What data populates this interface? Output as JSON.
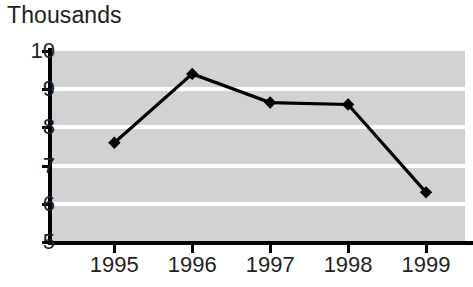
{
  "chart_data": {
    "type": "line",
    "title": "Thousands",
    "xlabel": "",
    "ylabel": "",
    "categories": [
      "1995",
      "1996",
      "1997",
      "1998",
      "1999"
    ],
    "values": [
      7.6,
      9.4,
      8.65,
      8.6,
      6.3
    ],
    "series": [
      {
        "name": "Thousands",
        "values": [
          7.6,
          9.4,
          8.65,
          8.6,
          6.3
        ]
      }
    ],
    "ylim": [
      5,
      10
    ],
    "yticks": [
      5,
      6,
      7,
      8,
      9,
      10
    ],
    "ytick_labels": [
      "5",
      "6",
      "7",
      "8",
      "9",
      "10"
    ],
    "xtick_labels": [
      "1995",
      "1996",
      "1997",
      "1998",
      "1999"
    ],
    "grid": true,
    "gridline_color": "#ffffff",
    "plot_background": "#d2d2d2",
    "line_color": "#000000",
    "marker": "diamond",
    "marker_color": "#000000",
    "legend": false,
    "legend_position": "none"
  },
  "axes": {
    "y_labels": [
      "10",
      "9",
      "8",
      "7",
      "6",
      "5"
    ],
    "x_labels": [
      "1995",
      "1996",
      "1997",
      "1998",
      "1999"
    ]
  }
}
